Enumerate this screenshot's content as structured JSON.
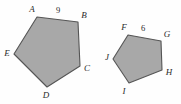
{
  "figure": {
    "background_color": "#fefefe",
    "fill_color": "#a8a8a8",
    "stroke_color": "#555555",
    "label_color": "#2b2b2b"
  },
  "shapes": [
    {
      "name": "pentagon-abcde",
      "points": "37,17 78,22 80,66 47,87 14,54",
      "vertices": [
        {
          "label": "A",
          "x": 32,
          "y": 10
        },
        {
          "label": "B",
          "x": 84,
          "y": 16
        },
        {
          "label": "C",
          "x": 87,
          "y": 69
        },
        {
          "label": "D",
          "x": 46,
          "y": 96
        },
        {
          "label": "E",
          "x": 7,
          "y": 54
        }
      ],
      "side_labels": [
        {
          "label": "9",
          "x": 58,
          "y": 11
        }
      ]
    },
    {
      "name": "pentagon-fghij",
      "points": "128,35 161,41 162,70 129,83 113,59",
      "vertices": [
        {
          "label": "F",
          "x": 124,
          "y": 28
        },
        {
          "label": "G",
          "x": 167,
          "y": 35
        },
        {
          "label": "H",
          "x": 169,
          "y": 73
        },
        {
          "label": "I",
          "x": 124,
          "y": 92
        },
        {
          "label": "J",
          "x": 107,
          "y": 58
        }
      ],
      "side_labels": [
        {
          "label": "6",
          "x": 143,
          "y": 29
        }
      ]
    }
  ]
}
